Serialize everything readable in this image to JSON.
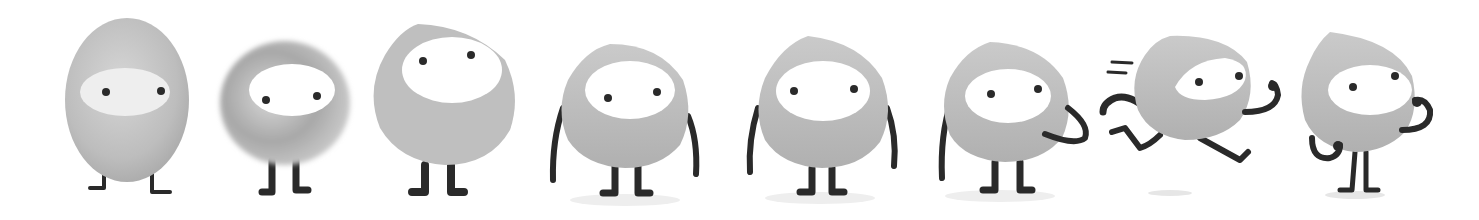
{
  "sheet": {
    "title": "",
    "description": "Character design evolution: eight grey blob mascots with white face window and two dot eyes",
    "background": "#ffffff",
    "colors": {
      "body": "#bdbdbd",
      "body_shade": "#a9a9a9",
      "face": "#ffffff",
      "eye": "#2a2a2a",
      "limb": "#2a2a2a",
      "shadow": "#e6e6e6"
    },
    "characters": [
      {
        "index": 1,
        "label": "egg-sketch",
        "pose": "standing, no arms, glossy egg body"
      },
      {
        "index": 2,
        "label": "blurry-sketch",
        "pose": "standing, no arms, soft painted ring body"
      },
      {
        "index": 3,
        "label": "flat-round",
        "pose": "standing, no arms, large face window"
      },
      {
        "index": 4,
        "label": "arms-down",
        "pose": "standing, arms at sides"
      },
      {
        "index": 5,
        "label": "arms-down-alt",
        "pose": "standing, arms at sides"
      },
      {
        "index": 6,
        "label": "hand-on-hip",
        "pose": "standing, right hand on belly"
      },
      {
        "index": 7,
        "label": "running",
        "pose": "running with speed lines"
      },
      {
        "index": 8,
        "label": "thinking",
        "pose": "standing, hand at chin"
      }
    ]
  }
}
